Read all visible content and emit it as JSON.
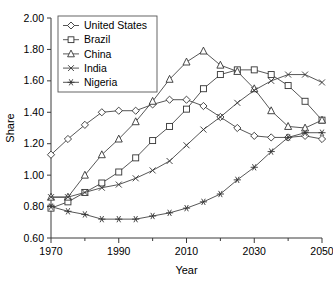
{
  "chart_data": {
    "type": "line",
    "title": "",
    "xlabel": "Year",
    "ylabel": "Share",
    "xlim": [
      1970,
      2050
    ],
    "ylim": [
      0.6,
      2.0
    ],
    "grid": false,
    "legend_position": "top-left",
    "xticks": [
      1970,
      1990,
      2010,
      2030,
      2050
    ],
    "xticklabels": [
      "1970",
      "1990",
      "2010",
      "2030",
      "2050"
    ],
    "xminorticks": [
      1980,
      2000,
      2020,
      2040
    ],
    "yticks": [
      0.6,
      0.8,
      1.0,
      1.2,
      1.4,
      1.6,
      1.8,
      2.0
    ],
    "yticklabels": [
      "0.60",
      "0.80",
      "1.00",
      "1.20",
      "1.40",
      "1.60",
      "1.80",
      "2.00"
    ],
    "x": [
      1970,
      1975,
      1980,
      1985,
      1990,
      1995,
      2000,
      2005,
      2010,
      2015,
      2020,
      2025,
      2030,
      2035,
      2040,
      2045,
      2050
    ],
    "series": [
      {
        "name": "United States",
        "marker": "diamond",
        "values": [
          1.13,
          1.23,
          1.32,
          1.4,
          1.41,
          1.41,
          1.45,
          1.48,
          1.48,
          1.44,
          1.37,
          1.3,
          1.25,
          1.24,
          1.24,
          1.25,
          1.23
        ]
      },
      {
        "name": "Brazil",
        "marker": "square",
        "values": [
          0.79,
          0.83,
          0.89,
          0.95,
          1.02,
          1.11,
          1.22,
          1.31,
          1.42,
          1.55,
          1.64,
          1.67,
          1.67,
          1.64,
          1.57,
          1.47,
          1.35
        ]
      },
      {
        "name": "China",
        "marker": "triangle",
        "values": [
          0.86,
          0.86,
          1.0,
          1.13,
          1.23,
          1.34,
          1.47,
          1.61,
          1.72,
          1.79,
          1.7,
          1.66,
          1.55,
          1.41,
          1.31,
          1.3,
          1.35
        ]
      },
      {
        "name": "India",
        "marker": "x",
        "values": [
          0.86,
          0.86,
          0.89,
          0.92,
          0.94,
          0.98,
          1.03,
          1.09,
          1.19,
          1.29,
          1.37,
          1.46,
          1.54,
          1.6,
          1.64,
          1.64,
          1.59
        ]
      },
      {
        "name": "Nigeria",
        "marker": "asterisk",
        "values": [
          0.8,
          0.77,
          0.75,
          0.72,
          0.72,
          0.72,
          0.74,
          0.76,
          0.79,
          0.83,
          0.88,
          0.97,
          1.05,
          1.15,
          1.24,
          1.27,
          1.27
        ]
      }
    ]
  },
  "legend": {
    "items": [
      {
        "label": "United States"
      },
      {
        "label": "Brazil"
      },
      {
        "label": "China"
      },
      {
        "label": "India"
      },
      {
        "label": "Nigeria"
      }
    ]
  },
  "colors": {
    "line": "#444444",
    "axis": "#3a3a3a",
    "marker_fill": "#ffffff",
    "marker_stroke": "#333333",
    "background": "#ffffff"
  }
}
